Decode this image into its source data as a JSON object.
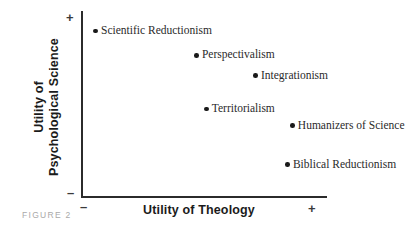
{
  "figure": {
    "caption": "FIGURE 2"
  },
  "axes": {
    "x": {
      "title": "Utility of Theology",
      "low_sign": "–",
      "high_sign": "+"
    },
    "y": {
      "title_line1": "Utility of",
      "title_line2": "Psychological Science",
      "low_sign": "–",
      "high_sign": "+"
    }
  },
  "chart_data": {
    "type": "scatter",
    "title": "FIGURE 2",
    "xlabel": "Utility of Theology",
    "ylabel": "Utility of Psychological Science",
    "xlim": [
      0,
      100
    ],
    "ylim": [
      0,
      100
    ],
    "grid": false,
    "legend": "none",
    "xtick_labels": [
      "–",
      "+"
    ],
    "ytick_labels": [
      "–",
      "+"
    ],
    "points": [
      {
        "label": "Scientific Reductionism",
        "x": 6,
        "y": 91
      },
      {
        "label": "Perspectivalism",
        "x": 47,
        "y": 78
      },
      {
        "label": "Integrationism",
        "x": 71,
        "y": 67
      },
      {
        "label": "Territorialism",
        "x": 51,
        "y": 49
      },
      {
        "label": "Humanizers of Science",
        "x": 86,
        "y": 40
      },
      {
        "label": "Biblical Reductionism",
        "x": 84,
        "y": 19
      }
    ]
  }
}
